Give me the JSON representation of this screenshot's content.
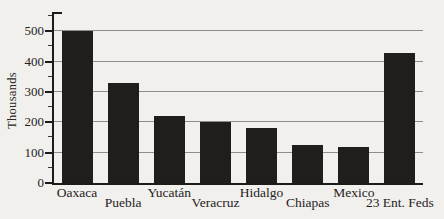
{
  "chart_data": {
    "type": "bar",
    "title": "",
    "xlabel": "",
    "ylabel": "Thousands",
    "categories": [
      "Oaxaca",
      "Puebla",
      "Yucatán",
      "Veracruz",
      "Hidalgo",
      "Chiapas",
      "Mexico",
      "23 Ent. Feds"
    ],
    "values": [
      500,
      330,
      220,
      200,
      180,
      125,
      120,
      430
    ],
    "ylim": [
      0,
      550
    ],
    "yticks": [
      0,
      100,
      200,
      300,
      400,
      500
    ],
    "ytick_minor_step": 50,
    "grid": true,
    "legend": false,
    "bar_color": "#201d1b",
    "axis_color": "#1d1b19",
    "gridline_color": "#8f8d89",
    "background_color": "#f2f0ec",
    "label_rows": "staggered"
  }
}
